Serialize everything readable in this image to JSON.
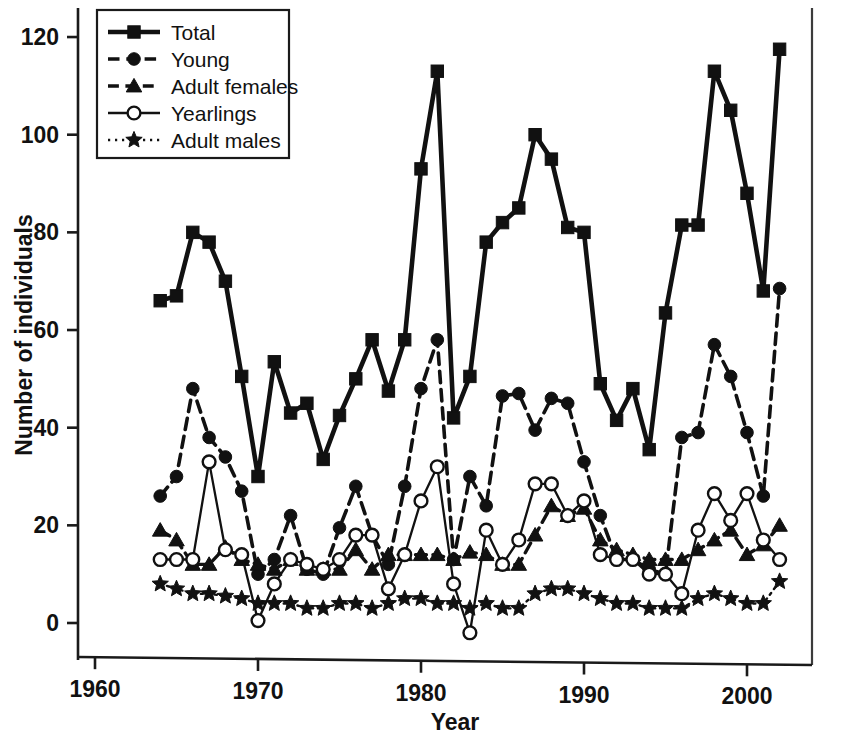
{
  "chart_data": {
    "type": "line",
    "title": "",
    "xlabel": "Year",
    "ylabel": "Number of individuals",
    "xlim": [
      1960,
      2003.5
    ],
    "ylim": [
      -6,
      126
    ],
    "xticks": [
      1960,
      1970,
      1980,
      1990,
      2000
    ],
    "xtick_labels": [
      "1960",
      "1970",
      "1980",
      "1990",
      "2000"
    ],
    "yticks": [
      0,
      20,
      40,
      60,
      80,
      100,
      120
    ],
    "ytick_labels": [
      "0",
      "20",
      "40",
      "60",
      "80",
      "100",
      "120"
    ],
    "grid": false,
    "legend_position": "top-left",
    "x": [
      1964,
      1965,
      1966,
      1967,
      1968,
      1969,
      1970,
      1971,
      1972,
      1973,
      1974,
      1975,
      1976,
      1977,
      1978,
      1979,
      1980,
      1981,
      1982,
      1983,
      1984,
      1985,
      1986,
      1987,
      1988,
      1989,
      1990,
      1991,
      1992,
      1993,
      1994,
      1995,
      1996,
      1997,
      1998,
      1999,
      2000,
      2001,
      2002
    ],
    "series": [
      {
        "name": "Total",
        "marker": "filled-square",
        "linestyle": "solid",
        "values": [
          66,
          67,
          80,
          78,
          70,
          50.5,
          30,
          53.5,
          43,
          45,
          33.5,
          42.5,
          50,
          58,
          47.5,
          58,
          93,
          113,
          42,
          50.5,
          78,
          82,
          85,
          100,
          95,
          81,
          80,
          49,
          41.5,
          48,
          35.5,
          63.5,
          81.5,
          81.5,
          113,
          105,
          88,
          68,
          117.5
        ]
      },
      {
        "name": "Young",
        "marker": "filled-circle",
        "linestyle": "dashed",
        "values": [
          26,
          30,
          48,
          38,
          34,
          27,
          10,
          13,
          22,
          11,
          10,
          19.5,
          28,
          18,
          12,
          28,
          48,
          58,
          13,
          30,
          24,
          46.5,
          47,
          39.5,
          46,
          45,
          33,
          22,
          13,
          13,
          11,
          10,
          38,
          39,
          57,
          50.5,
          39,
          26,
          68.5
        ]
      },
      {
        "name": "Adult females",
        "marker": "filled-triangle",
        "linestyle": "dashed",
        "values": [
          19,
          17,
          12,
          12,
          15.5,
          13,
          12,
          11,
          13,
          11,
          11,
          11,
          15,
          11,
          14,
          14,
          14,
          14,
          13,
          14.5,
          14,
          12,
          12,
          18,
          24,
          22,
          23.5,
          17,
          15,
          14,
          13,
          13,
          13,
          15,
          17,
          19,
          14,
          16,
          20
        ]
      },
      {
        "name": "Yearlings",
        "marker": "open-circle",
        "linestyle": "solid",
        "values": [
          13,
          13,
          13,
          33,
          15,
          14,
          0.5,
          8,
          13,
          12,
          11,
          13,
          18,
          18,
          7,
          14,
          25,
          32,
          8,
          -2,
          19,
          12,
          17,
          28.5,
          28.5,
          22,
          25,
          14,
          13,
          13,
          10,
          10,
          6,
          19,
          26.5,
          21,
          26.5,
          17,
          13
        ]
      },
      {
        "name": "Adult males",
        "marker": "filled-star",
        "linestyle": "dotted",
        "values": [
          8,
          7,
          6,
          6,
          5.5,
          5,
          4,
          4,
          4,
          3,
          3,
          4,
          4,
          3,
          4,
          5,
          5,
          4,
          4,
          3,
          4,
          3,
          3,
          6,
          7,
          7,
          6,
          5,
          4,
          4,
          3,
          3,
          3,
          5,
          6,
          5,
          4,
          4,
          8.5
        ]
      }
    ]
  },
  "legend": {
    "entries": [
      {
        "label": "Total"
      },
      {
        "label": "Young"
      },
      {
        "label": "Adult females"
      },
      {
        "label": "Yearlings"
      },
      {
        "label": "Adult males"
      }
    ]
  },
  "colors": {
    "ink": "#111111",
    "background": "#ffffff"
  }
}
